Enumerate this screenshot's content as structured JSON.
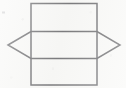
{
  "figure": {
    "canvas": {
      "width": 126,
      "height": 88,
      "background_color": "#f7f7f5"
    },
    "style": {
      "stroke_color": "#3a3a3e",
      "stroke_width": 1.5,
      "fill": "none"
    },
    "shapes": [
      {
        "id": "rectangle",
        "name": "rectangle",
        "type": "rect",
        "x": 31,
        "y": 3.5,
        "width": 66,
        "height": 81.5,
        "points": [
          [
            31,
            3.5
          ],
          [
            97,
            3.5
          ],
          [
            97,
            85
          ],
          [
            31,
            85
          ]
        ]
      },
      {
        "id": "hexagon",
        "name": "hexagon",
        "type": "polygon",
        "points": [
          [
            8,
            45
          ],
          [
            31,
            31.5
          ],
          [
            97,
            31.5
          ],
          [
            120,
            45
          ],
          [
            97,
            58.5
          ],
          [
            31,
            58.5
          ]
        ],
        "left_vertex": [
          8,
          45
        ],
        "right_vertex": [
          120,
          45
        ],
        "top_edge_y": 31.5,
        "bottom_edge_y": 58.5
      }
    ],
    "intersections": {
      "count": 4,
      "points": [
        [
          31,
          31.5
        ],
        [
          97,
          31.5
        ],
        [
          31,
          58.5
        ],
        [
          97,
          58.5
        ]
      ]
    },
    "artifacts": [
      {
        "id": "speck-left",
        "name": "scan-speck",
        "x": 2,
        "y": 11.5,
        "width": 3,
        "height": 2,
        "color": "#b9b9bb"
      }
    ]
  }
}
